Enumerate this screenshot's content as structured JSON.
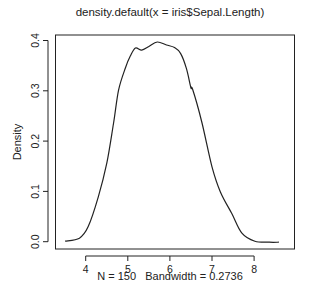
{
  "chart_data": {
    "type": "line",
    "title": "density.default(x = iris$Sepal.Length)",
    "xlabel": "N = 150   Bandwidth = 0.2736",
    "ylabel": "Density",
    "xlim": [
      3.5,
      8.8
    ],
    "ylim": [
      0,
      0.41
    ],
    "x_ticks": [
      4,
      5,
      6,
      7,
      8
    ],
    "x_tick_labels": [
      "4",
      "5",
      "6",
      "7",
      "8"
    ],
    "y_ticks": [
      0.0,
      0.1,
      0.2,
      0.3,
      0.4
    ],
    "y_tick_labels": [
      "0.0",
      "0.1",
      "0.2",
      "0.3",
      "0.4"
    ],
    "grid": false,
    "legend": null,
    "series": [
      {
        "name": "density",
        "x": [
          3.51,
          3.85,
          4.06,
          4.3,
          4.5,
          4.66,
          4.78,
          4.94,
          5.06,
          5.18,
          5.33,
          5.5,
          5.7,
          5.92,
          6.11,
          6.25,
          6.39,
          6.5,
          6.54,
          6.76,
          7.0,
          7.2,
          7.47,
          7.71,
          8.02,
          8.36,
          8.59
        ],
        "y": [
          0.001,
          0.007,
          0.03,
          0.089,
          0.156,
          0.235,
          0.301,
          0.345,
          0.369,
          0.385,
          0.381,
          0.388,
          0.397,
          0.391,
          0.386,
          0.375,
          0.345,
          0.306,
          0.303,
          0.237,
          0.149,
          0.099,
          0.056,
          0.017,
          0.001,
          -0.001,
          -0.001
        ]
      }
    ]
  }
}
